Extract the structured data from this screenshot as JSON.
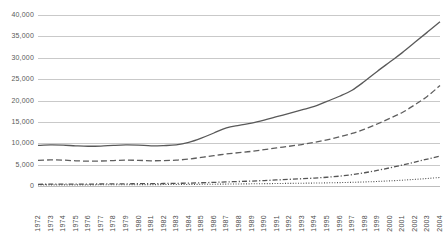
{
  "chart_data": {
    "type": "line",
    "title": "",
    "subtitle": "",
    "xlabel": "",
    "ylabel": "",
    "grid": true,
    "legend": "none",
    "ylim": [
      0,
      40000
    ],
    "ytick_labels": [
      "40,000",
      "35,000",
      "30,000",
      "25,000",
      "20,000",
      "15,000",
      "10,000",
      "5,000",
      "0"
    ],
    "ytick_values": [
      40000,
      35000,
      30000,
      25000,
      20000,
      15000,
      10000,
      5000,
      0
    ],
    "categories": [
      "1972",
      "1973",
      "1974",
      "1975",
      "1976",
      "1977",
      "1978",
      "1979",
      "1980",
      "1981",
      "1982",
      "1983",
      "1984",
      "1985",
      "1986",
      "1987",
      "1988",
      "1989",
      "1990",
      "1991",
      "1992",
      "1993",
      "1994",
      "1995",
      "1996",
      "1997",
      "1998",
      "1999",
      "2000",
      "2001",
      "2002",
      "2003",
      "2004"
    ],
    "series": [
      {
        "name": "series-1-solid",
        "style": "solid",
        "color": "#595959",
        "values": [
          9500,
          9600,
          9550,
          9400,
          9300,
          9350,
          9500,
          9600,
          9550,
          9400,
          9450,
          9600,
          10200,
          11200,
          12400,
          13600,
          14200,
          14700,
          15400,
          16200,
          17000,
          17800,
          18600,
          19800,
          21000,
          22400,
          24500,
          26800,
          29000,
          31200,
          33600,
          36000,
          38400
        ]
      },
      {
        "name": "series-2-dashed",
        "style": "dashed",
        "color": "#5e5e5e",
        "values": [
          6000,
          6100,
          6050,
          5900,
          5800,
          5850,
          5950,
          6050,
          6000,
          5900,
          5950,
          6050,
          6300,
          6700,
          7100,
          7500,
          7800,
          8100,
          8500,
          8900,
          9300,
          9700,
          10200,
          10800,
          11500,
          12300,
          13300,
          14500,
          15800,
          17200,
          19000,
          21000,
          23500
        ]
      },
      {
        "name": "series-3-dash-dot",
        "style": "dashdot",
        "color": "#555555",
        "values": [
          400,
          420,
          430,
          440,
          450,
          470,
          490,
          510,
          530,
          550,
          580,
          620,
          680,
          760,
          850,
          950,
          1050,
          1150,
          1280,
          1420,
          1560,
          1700,
          1860,
          2050,
          2300,
          2650,
          3100,
          3650,
          4250,
          4900,
          5600,
          6300,
          7000
        ]
      },
      {
        "name": "series-4-dotted",
        "style": "dotted",
        "color": "#4f4f4f",
        "values": [
          250,
          255,
          260,
          265,
          270,
          280,
          290,
          300,
          310,
          320,
          335,
          350,
          370,
          395,
          420,
          450,
          480,
          510,
          545,
          580,
          615,
          650,
          690,
          735,
          790,
          860,
          950,
          1060,
          1200,
          1360,
          1550,
          1760,
          2000
        ]
      }
    ]
  }
}
